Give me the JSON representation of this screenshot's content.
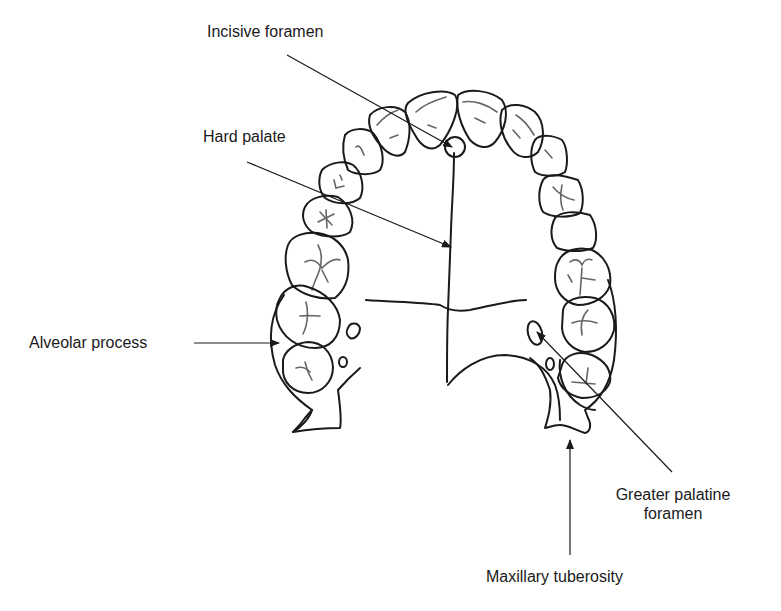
{
  "diagram": {
    "labels": {
      "incisive_foramen": "Incisive foramen",
      "hard_palate": "Hard palate",
      "alveolar_process": "Alveolar process",
      "greater_palatine_foramen_line1": "Greater palatine",
      "greater_palatine_foramen_line2": "foramen",
      "maxillary_tuberosity": "Maxillary tuberosity"
    },
    "colors": {
      "line": "#1a1a1a",
      "fissure": "#666666",
      "background": "#ffffff"
    }
  }
}
